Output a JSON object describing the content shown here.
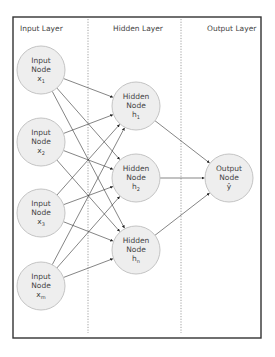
{
  "diagram": {
    "type": "neural-network",
    "frame": {
      "x": 13,
      "y": 17,
      "width": 248,
      "height": 321
    },
    "dividers": [
      88,
      181
    ],
    "layers": [
      {
        "label": "Input Layer",
        "label_x": 20
      },
      {
        "label": "Hidden Layer",
        "label_x": 113
      },
      {
        "label": "Output Layer",
        "label_x": 207
      }
    ],
    "input_nodes": [
      {
        "line1": "Input",
        "line2": "Node",
        "var": "x",
        "sub": "1",
        "cx": 41,
        "cy": 70
      },
      {
        "line1": "Input",
        "line2": "Node",
        "var": "x",
        "sub": "2",
        "cx": 41,
        "cy": 142
      },
      {
        "line1": "Input",
        "line2": "Node",
        "var": "x",
        "sub": "3",
        "cx": 41,
        "cy": 213
      },
      {
        "line1": "Input",
        "line2": "Node",
        "var": "x",
        "sub": "m",
        "cx": 41,
        "cy": 286
      }
    ],
    "hidden_nodes": [
      {
        "line1": "Hidden",
        "line2": "Node",
        "var": "h",
        "sub": "1",
        "cx": 136,
        "cy": 106
      },
      {
        "line1": "Hidden",
        "line2": "Node",
        "var": "h",
        "sub": "2",
        "cx": 136,
        "cy": 178
      },
      {
        "line1": "Hidden",
        "line2": "Node",
        "var": "h",
        "sub": "n",
        "cx": 136,
        "cy": 250
      }
    ],
    "output_nodes": [
      {
        "line1": "Output",
        "line2": "Node",
        "var": "ŷ",
        "sub": "",
        "cx": 229,
        "cy": 178
      }
    ],
    "node_radius": 24,
    "colors": {
      "node_fill": "#eeeeee",
      "node_stroke": "#c4c4c4",
      "frame": "#333333",
      "divider": "#888888",
      "edge": "#333333",
      "text": "#444444"
    }
  }
}
